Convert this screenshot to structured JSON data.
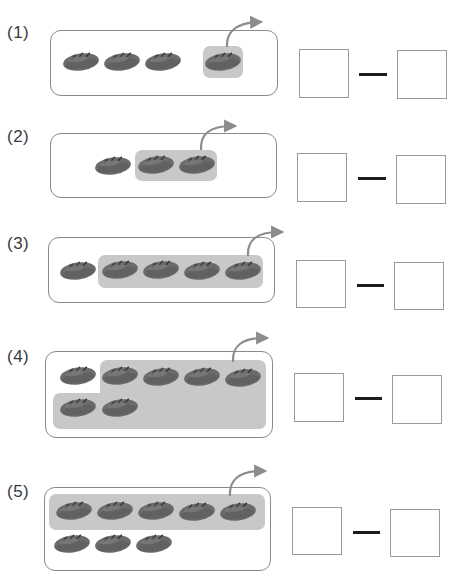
{
  "colors": {
    "bread_fill": "#6b6b6b",
    "bread_dark": "#4a4a4a",
    "highlight": "#c8c8c8",
    "frame_border": "#8a8a8a",
    "box_border": "#9a9a9a",
    "dash": "#1c1c1c",
    "arrow": "#8c8c8c"
  },
  "problems": [
    {
      "label": "(1)",
      "total": 4,
      "taken": 1,
      "answer_left": "",
      "operator": "—",
      "answer_right": ""
    },
    {
      "label": "(2)",
      "total": 3,
      "taken": 2,
      "answer_left": "",
      "operator": "—",
      "answer_right": ""
    },
    {
      "label": "(3)",
      "total": 5,
      "taken": 4,
      "answer_left": "",
      "operator": "—",
      "answer_right": ""
    },
    {
      "label": "(4)",
      "total": 7,
      "taken": 6,
      "answer_left": "",
      "operator": "—",
      "answer_right": ""
    },
    {
      "label": "(5)",
      "total": 8,
      "taken": 5,
      "answer_left": "",
      "operator": "—",
      "answer_right": ""
    }
  ],
  "icons": {
    "item": "bread-icon",
    "move": "curved-arrow-icon"
  }
}
